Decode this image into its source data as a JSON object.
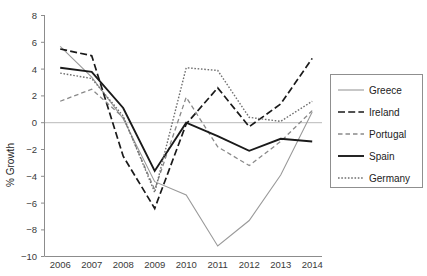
{
  "chart_data": {
    "type": "line",
    "title": "",
    "xlabel": "",
    "ylabel": "% Growth",
    "categories": [
      "2006",
      "2007",
      "2008",
      "2009",
      "2010",
      "2011",
      "2012",
      "2013",
      "2014"
    ],
    "x": [
      2006,
      2007,
      2008,
      2009,
      2010,
      2011,
      2012,
      2013,
      2014
    ],
    "ylim": [
      -10,
      8
    ],
    "yticks": [
      -10,
      -8,
      -6,
      -4,
      -2,
      0,
      2,
      4,
      6,
      8
    ],
    "ytick_labels": [
      "−10",
      "−8",
      "−6",
      "−4",
      "−2",
      "0",
      "2",
      "4",
      "6",
      "8"
    ],
    "grid": false,
    "zero_line": true,
    "legend_position": "right",
    "series": [
      {
        "name": "Greece",
        "style": "solid-thin",
        "color": "#9a9a9a",
        "values": [
          5.7,
          3.4,
          0.3,
          -4.4,
          -5.4,
          -9.2,
          -7.3,
          -3.9,
          0.8
        ]
      },
      {
        "name": "Ireland",
        "style": "long-dash",
        "color": "#1a1a1a",
        "values": [
          5.5,
          5.0,
          -2.5,
          -6.4,
          -0.1,
          2.6,
          -0.3,
          1.4,
          4.8
        ]
      },
      {
        "name": "Portugal",
        "style": "dashed",
        "color": "#8a8a8a",
        "values": [
          1.6,
          2.5,
          0.4,
          -5.0,
          1.9,
          -1.8,
          -3.2,
          -1.4,
          0.9
        ]
      },
      {
        "name": "Spain",
        "style": "solid-thick",
        "color": "#1a1a1a",
        "values": [
          4.1,
          3.8,
          1.1,
          -3.6,
          0.0,
          -1.0,
          -2.1,
          -1.2,
          -1.4
        ]
      },
      {
        "name": "Germany",
        "style": "dotted",
        "color": "#6f6f6f",
        "values": [
          3.7,
          3.3,
          0.5,
          -5.2,
          4.1,
          3.9,
          0.4,
          0.1,
          1.6
        ]
      }
    ]
  },
  "axes": {
    "ylabel": "% Growth",
    "ytick_labels": [
      "8",
      "6",
      "4",
      "2",
      "0",
      "−2",
      "−4",
      "−6",
      "−8",
      "−10"
    ],
    "xtick_labels": [
      "2006",
      "2007",
      "2008",
      "2009",
      "2010",
      "2011",
      "2012",
      "2013",
      "2014"
    ]
  },
  "legend": {
    "items": [
      {
        "label": "Greece",
        "swatch": "solid-thin"
      },
      {
        "label": "Ireland",
        "swatch": "long-dash"
      },
      {
        "label": "Portugal",
        "swatch": "dashed"
      },
      {
        "label": "Spain",
        "swatch": "solid-thick"
      },
      {
        "label": "Germany",
        "swatch": "dotted"
      }
    ]
  }
}
